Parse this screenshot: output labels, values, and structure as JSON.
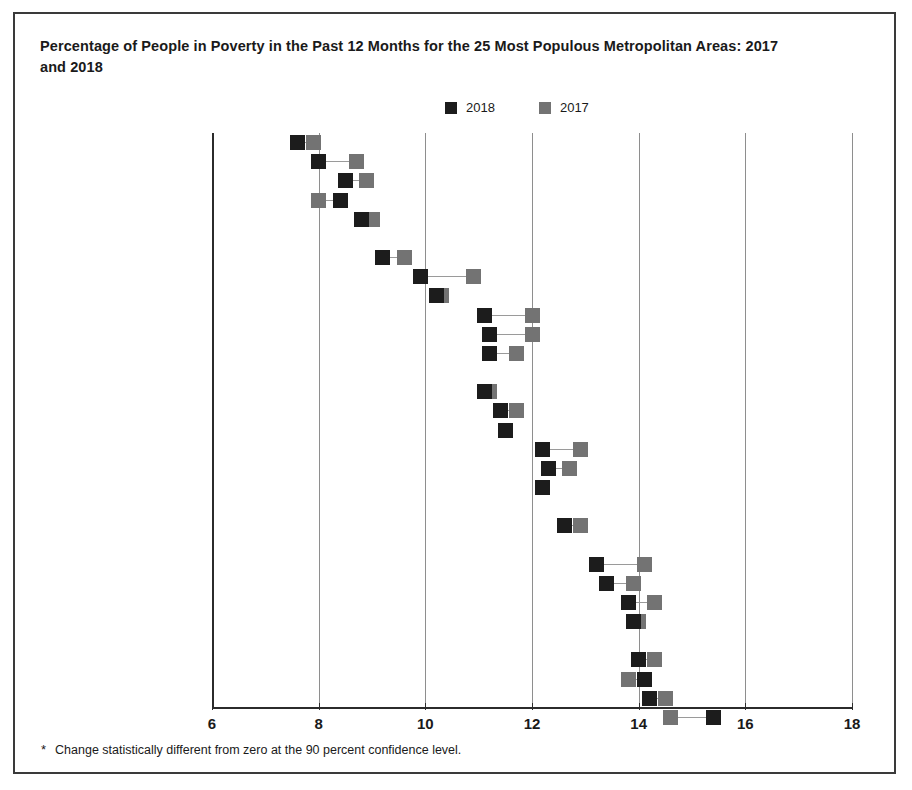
{
  "title": "Percentage of People in Poverty in the Past 12 Months for the 25 Most Populous Metropolitan Areas: 2017 and 2018",
  "footnote": {
    "marker": "*",
    "text": "Change statistically different from zero at the 90 percent confidence level."
  },
  "legend": [
    {
      "label": "2018",
      "color": "#1c1c1c",
      "swatch": "square-marker-2018"
    },
    {
      "label": "2017",
      "color": "#737373",
      "swatch": "square-marker-2017"
    }
  ],
  "colors": {
    "series_2018": "#1c1c1c",
    "series_2017": "#737373",
    "gridline": "#8e8e8e",
    "axis": "#2b2b2b",
    "border": "#3a3a3a",
    "muted_label": "#8a8a8a"
  },
  "chart_data": {
    "type": "scatter",
    "title": "Percentage of People in Poverty in the Past 12 Months for the 25 Most Populous Metropolitan Areas: 2017 and 2018",
    "xlabel": "",
    "ylabel": "",
    "xlim": [
      6,
      18
    ],
    "xticks": [
      6,
      8,
      10,
      12,
      14,
      16,
      18
    ],
    "grid": true,
    "legend_position": "top-center",
    "series": [
      {
        "name": "2018",
        "color": "#1c1c1c"
      },
      {
        "name": "2017",
        "color": "#737373"
      }
    ],
    "categories": [
      "Washington, DC",
      "Denver",
      "San Francisco",
      "Minneapolis–St. Paul",
      "Seattle",
      "Boston",
      "*Portland",
      "Baltimore",
      "*Atlanta",
      "*Charlotte",
      "*Chicago",
      "Dallas",
      "San Diego",
      "St. Louis",
      "*Phoenix",
      "*New York",
      "Philadelphia",
      "*All Metro Areas",
      "*Los Angeles",
      "Tampa",
      "Riverside",
      "Orlando",
      "Miami",
      "Houston",
      "Detroit",
      "San Antonio"
    ],
    "rows": [
      {
        "label": "Washington, DC",
        "starred": false,
        "muted": false,
        "group": 0,
        "v2018": 7.6,
        "v2017": 7.9
      },
      {
        "label": "Denver",
        "starred": false,
        "muted": false,
        "group": 0,
        "v2018": 8.0,
        "v2017": 8.7
      },
      {
        "label": "San Francisco",
        "starred": false,
        "muted": false,
        "group": 0,
        "v2018": 8.5,
        "v2017": 8.9
      },
      {
        "label": "Minneapolis–St. Paul",
        "starred": false,
        "muted": false,
        "group": 0,
        "v2018": 8.4,
        "v2017": 8.0
      },
      {
        "label": "Seattle",
        "starred": false,
        "muted": false,
        "group": 0,
        "v2018": 8.8,
        "v2017": 9.0
      },
      {
        "label": "Boston",
        "starred": false,
        "muted": false,
        "group": 1,
        "v2018": 9.2,
        "v2017": 9.6
      },
      {
        "label": "Portland",
        "starred": true,
        "muted": false,
        "group": 1,
        "v2018": 9.9,
        "v2017": 10.9
      },
      {
        "label": "Baltimore",
        "starred": false,
        "muted": false,
        "group": 1,
        "v2018": 10.2,
        "v2017": 10.3
      },
      {
        "label": "Atlanta",
        "starred": true,
        "muted": false,
        "group": 1,
        "v2018": 11.1,
        "v2017": 12.0
      },
      {
        "label": "Charlotte",
        "starred": true,
        "muted": false,
        "group": 1,
        "v2018": 11.2,
        "v2017": 12.0
      },
      {
        "label": "Chicago",
        "starred": true,
        "muted": false,
        "group": 1,
        "v2018": 11.2,
        "v2017": 11.7
      },
      {
        "label": "Dallas",
        "starred": false,
        "muted": false,
        "group": 2,
        "v2018": 11.1,
        "v2017": 11.2
      },
      {
        "label": "San Diego",
        "starred": false,
        "muted": false,
        "group": 2,
        "v2018": 11.4,
        "v2017": 11.7
      },
      {
        "label": "St. Louis",
        "starred": false,
        "muted": false,
        "group": 2,
        "v2018": 11.5,
        "v2017": 11.5
      },
      {
        "label": "Phoenix",
        "starred": true,
        "muted": false,
        "group": 2,
        "v2018": 12.2,
        "v2017": 12.9
      },
      {
        "label": "New York",
        "starred": true,
        "muted": false,
        "group": 2,
        "v2018": 12.3,
        "v2017": 12.7
      },
      {
        "label": "Philadelphia",
        "starred": false,
        "muted": false,
        "group": 2,
        "v2018": 12.2,
        "v2017": 12.2
      },
      {
        "label": "All Metro Areas",
        "starred": true,
        "muted": true,
        "group": 3,
        "v2018": 12.6,
        "v2017": 12.9
      },
      {
        "label": "Los Angeles",
        "starred": true,
        "muted": false,
        "group": 4,
        "v2018": 13.2,
        "v2017": 14.1
      },
      {
        "label": "Tampa",
        "starred": false,
        "muted": false,
        "group": 4,
        "v2018": 13.4,
        "v2017": 13.9
      },
      {
        "label": "Riverside",
        "starred": false,
        "muted": false,
        "group": 4,
        "v2018": 13.8,
        "v2017": 14.3
      },
      {
        "label": "Orlando",
        "starred": false,
        "muted": false,
        "group": 4,
        "v2018": 13.9,
        "v2017": 14.0
      },
      {
        "label": "Miami",
        "starred": false,
        "muted": false,
        "group": 5,
        "v2018": 14.0,
        "v2017": 14.3
      },
      {
        "label": "Houston",
        "starred": false,
        "muted": false,
        "group": 5,
        "v2018": 14.1,
        "v2017": 13.8
      },
      {
        "label": "Detroit",
        "starred": false,
        "muted": false,
        "group": 5,
        "v2018": 14.2,
        "v2017": 14.5
      },
      {
        "label": "San Antonio",
        "starred": false,
        "muted": false,
        "group": 5,
        "v2018": 15.4,
        "v2017": 14.6
      }
    ]
  }
}
